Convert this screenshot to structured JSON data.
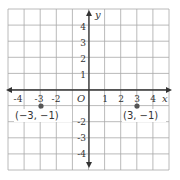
{
  "chart_data": {
    "type": "scatter",
    "title": "",
    "xlabel": "x",
    "ylabel": "y",
    "origin_label": "O",
    "xlim": [
      -5,
      5
    ],
    "ylim": [
      -5,
      5
    ],
    "grid": true,
    "x_ticks": [
      "-4",
      "-3",
      "-2",
      "1",
      "2",
      "3",
      "4"
    ],
    "y_ticks": [
      "4",
      "3",
      "2",
      "1",
      "-2",
      "-3",
      "-4"
    ],
    "points": [
      {
        "x": -3,
        "y": -1,
        "label": "(−3, −1)"
      },
      {
        "x": 3,
        "y": -1,
        "label": "(3, −1)"
      }
    ]
  },
  "colors": {
    "grid": "#a8a8a8",
    "axis": "#333333",
    "point": "#555555"
  }
}
